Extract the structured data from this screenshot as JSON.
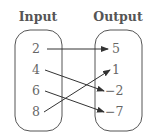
{
  "diagram": {
    "type": "mapping-diagram",
    "headers": {
      "input": "Input",
      "output": "Output"
    },
    "inputs": [
      "2",
      "4",
      "6",
      "8"
    ],
    "outputs": [
      "5",
      "1",
      "−2",
      "−7"
    ],
    "mappings": [
      {
        "from": "2",
        "to": "5"
      },
      {
        "from": "4",
        "to": "−2"
      },
      {
        "from": "6",
        "to": "−7"
      },
      {
        "from": "8",
        "to": "1"
      }
    ]
  }
}
